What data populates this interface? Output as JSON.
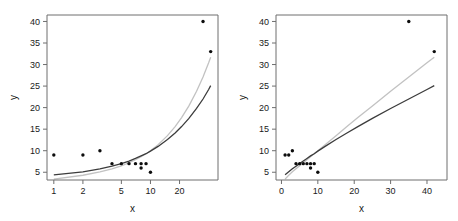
{
  "figure": {
    "title": "",
    "background": "#ffffff",
    "panel_count": 2
  },
  "colors": {
    "point": "#0d0d0d",
    "curve_dark": "#3c3c3c",
    "curve_light": "#c2c2c2",
    "axis": "#6e6e6e",
    "text": "#1a1a1a",
    "background": "#ffffff"
  },
  "chart_data": [
    {
      "type": "scatter",
      "panel": "left",
      "title": "",
      "xlabel": "x",
      "ylabel": "y",
      "xscale": "log",
      "yscale": "linear",
      "xlim": [
        0.85,
        50
      ],
      "ylim": [
        3.2,
        41.5
      ],
      "xticks": [
        1,
        2,
        5,
        10,
        20
      ],
      "xticklabels": [
        "1",
        "2",
        "5",
        "10",
        "20"
      ],
      "yticks": [
        5,
        10,
        15,
        20,
        25,
        30,
        35,
        40
      ],
      "yticklabels": [
        "5",
        "10",
        "15",
        "20",
        "25",
        "30",
        "35",
        "40"
      ],
      "grid": false,
      "legend": "none",
      "points": [
        {
          "x": 1,
          "y": 9
        },
        {
          "x": 2,
          "y": 9
        },
        {
          "x": 3,
          "y": 10
        },
        {
          "x": 4,
          "y": 7
        },
        {
          "x": 5,
          "y": 7
        },
        {
          "x": 6,
          "y": 7
        },
        {
          "x": 7,
          "y": 7
        },
        {
          "x": 8,
          "y": 7
        },
        {
          "x": 8,
          "y": 6
        },
        {
          "x": 9,
          "y": 7
        },
        {
          "x": 10,
          "y": 5
        },
        {
          "x": 35,
          "y": 40
        },
        {
          "x": 42,
          "y": 33
        }
      ],
      "series": [
        {
          "name": "fit-dark",
          "color": "#3c3c3c",
          "x": [
            1,
            2,
            3,
            4,
            5,
            6,
            7,
            8,
            9,
            10,
            12,
            15,
            18,
            21,
            25,
            30,
            35,
            40,
            42
          ],
          "values": [
            4.4,
            5.1,
            5.8,
            6.4,
            7.0,
            7.6,
            8.2,
            8.8,
            9.3,
            9.9,
            11.0,
            12.6,
            14.1,
            15.6,
            17.5,
            19.8,
            22.0,
            24.2,
            25.1
          ]
        },
        {
          "name": "fit-light",
          "color": "#c2c2c2",
          "x": [
            1,
            2,
            3,
            4,
            5,
            6,
            7,
            8,
            9,
            10,
            12,
            15,
            18,
            21,
            25,
            30,
            35,
            40,
            42
          ],
          "values": [
            3.4,
            4.3,
            5.1,
            5.8,
            6.5,
            7.2,
            7.9,
            8.6,
            9.3,
            10.0,
            11.4,
            13.5,
            15.6,
            17.7,
            20.4,
            23.8,
            27.1,
            30.4,
            31.7
          ]
        }
      ]
    },
    {
      "type": "scatter",
      "panel": "right",
      "title": "",
      "xlabel": "x",
      "ylabel": "y",
      "xscale": "linear",
      "yscale": "linear",
      "xlim": [
        -1.5,
        45.5
      ],
      "ylim": [
        3.2,
        41.5
      ],
      "xticks": [
        0,
        10,
        20,
        30,
        40
      ],
      "xticklabels": [
        "0",
        "10",
        "20",
        "30",
        "40"
      ],
      "yticks": [
        5,
        10,
        15,
        20,
        25,
        30,
        35,
        40
      ],
      "yticklabels": [
        "5",
        "10",
        "15",
        "20",
        "25",
        "30",
        "35",
        "40"
      ],
      "grid": false,
      "legend": "none",
      "points": [
        {
          "x": 1,
          "y": 9
        },
        {
          "x": 2,
          "y": 9
        },
        {
          "x": 3,
          "y": 10
        },
        {
          "x": 4,
          "y": 7
        },
        {
          "x": 5,
          "y": 7
        },
        {
          "x": 6,
          "y": 7
        },
        {
          "x": 7,
          "y": 7
        },
        {
          "x": 8,
          "y": 7
        },
        {
          "x": 8,
          "y": 6
        },
        {
          "x": 9,
          "y": 7
        },
        {
          "x": 10,
          "y": 5
        },
        {
          "x": 35,
          "y": 40
        },
        {
          "x": 42,
          "y": 33
        }
      ],
      "series": [
        {
          "name": "fit-dark",
          "color": "#3c3c3c",
          "x": [
            1,
            2,
            3,
            4,
            5,
            6,
            7,
            8,
            9,
            10,
            12,
            15,
            18,
            21,
            25,
            30,
            35,
            40,
            42
          ],
          "values": [
            4.4,
            5.1,
            5.8,
            6.4,
            7.0,
            7.6,
            8.2,
            8.8,
            9.3,
            9.9,
            11.0,
            12.6,
            14.1,
            15.6,
            17.5,
            19.8,
            22.0,
            24.2,
            25.1
          ]
        },
        {
          "name": "fit-light",
          "color": "#c2c2c2",
          "x": [
            1,
            2,
            3,
            4,
            5,
            6,
            7,
            8,
            9,
            10,
            12,
            15,
            18,
            21,
            25,
            30,
            35,
            40,
            42
          ],
          "values": [
            3.4,
            4.3,
            5.1,
            5.8,
            6.5,
            7.2,
            7.9,
            8.6,
            9.3,
            10.0,
            11.4,
            13.5,
            15.6,
            17.7,
            20.4,
            23.8,
            27.1,
            30.4,
            31.7
          ]
        }
      ]
    }
  ]
}
